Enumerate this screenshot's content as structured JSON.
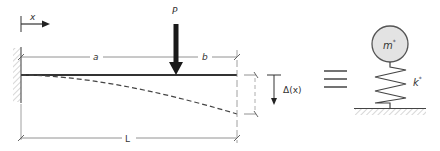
{
  "diagram": {
    "labels": {
      "x_axis": "x",
      "load": "P",
      "dim_a": "a",
      "dim_b": "b",
      "dim_L": "L",
      "deflection": "Δ(x)",
      "mass": "m*",
      "stiffness": "k*",
      "equivalence": "≡"
    },
    "mass_label": {
      "base": "m",
      "sup": "*"
    },
    "stiffness_label": {
      "base": "k",
      "sup": "*"
    },
    "colors": {
      "line": "#555555",
      "beam": "#333333",
      "load_arrow": "#1a1a1a",
      "mass_fill": "#e3e3e3",
      "hatch": "#bbbbbb"
    }
  }
}
